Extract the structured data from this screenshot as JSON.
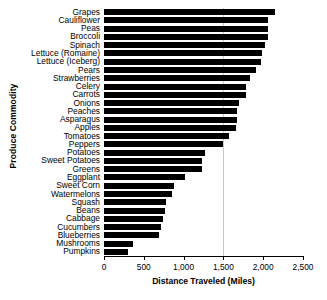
{
  "chart_data": {
    "type": "bar",
    "orientation": "horizontal",
    "title": "",
    "xlabel": "Distance Traveled (Miles)",
    "ylabel": "Produce Commodity",
    "xlim": [
      0,
      2500
    ],
    "xticks": [
      0,
      500,
      1000,
      1500,
      2000,
      2500
    ],
    "xticklabels": [
      "0",
      "500",
      "1,000",
      "1,500",
      "2,000",
      "2,500"
    ],
    "grid": "vertical-at-1500",
    "legend": "none",
    "bar_color": "#000000",
    "categories": [
      "Grapes",
      "Cauliflower",
      "Peas",
      "Broccoli",
      "Spinach",
      "Lettuce (Romaine)",
      "Lettuce (Iceberg)",
      "Pears",
      "Strawberries",
      "Celery",
      "Carrots",
      "Onions",
      "Peaches",
      "Asparagus",
      "Apples",
      "Tomatoes",
      "Peppers",
      "Potatoes",
      "Sweet Potatoes",
      "Greens",
      "Eggplant",
      "Sweet Corn",
      "Watermelons",
      "Squash",
      "Beans",
      "Cabbage",
      "Cucumbers",
      "Blueberries",
      "Mushrooms",
      "Pumpkins"
    ],
    "values": [
      2143,
      2055,
      2055,
      2055,
      2020,
      1990,
      1975,
      1910,
      1830,
      1780,
      1780,
      1690,
      1670,
      1670,
      1660,
      1570,
      1490,
      1270,
      1230,
      1230,
      1020,
      880,
      850,
      780,
      770,
      745,
      720,
      690,
      370,
      300
    ]
  }
}
